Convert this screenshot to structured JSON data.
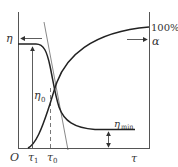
{
  "diagram": {
    "type": "viscosity and degree of cure vs time",
    "labels": {
      "eta": "η",
      "alpha": "α",
      "percent100": "100%",
      "eta0": "η",
      "eta0_sub": "0",
      "eta_min": "η",
      "eta_min_sub": "min",
      "origin": "O",
      "tau1": "τ",
      "tau1_sub": "1",
      "tau0": "τ",
      "tau0_sub": "0",
      "tau": "τ"
    },
    "curves": [
      {
        "name": "viscosity-curve",
        "description": "η: flat plateau then steep drop, levels off at η_min"
      },
      {
        "name": "cure-degree-curve",
        "description": "α: rises from τ1 toward 100%"
      }
    ],
    "colors": {
      "line": "#333333",
      "axis": "#555555"
    }
  }
}
